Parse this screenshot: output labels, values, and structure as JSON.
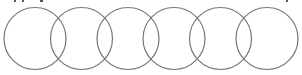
{
  "diagram": {
    "type": "overlapping-circles-chain",
    "circle_count": 6,
    "stroke_color": "#777777",
    "fill_color": "none",
    "circles": [
      {
        "cx": 35,
        "cy": 38.5,
        "r": 31
      },
      {
        "cx": 81.5,
        "cy": 38.5,
        "r": 31
      },
      {
        "cx": 128,
        "cy": 38.5,
        "r": 31
      },
      {
        "cx": 174,
        "cy": 38.5,
        "r": 31
      },
      {
        "cx": 220.5,
        "cy": 38.5,
        "r": 31
      },
      {
        "cx": 267,
        "cy": 38.5,
        "r": 31
      }
    ]
  }
}
